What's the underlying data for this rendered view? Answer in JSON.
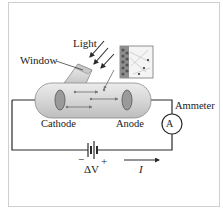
{
  "diagram": {
    "labels": {
      "light": "Light",
      "window": "Window",
      "cathode": "Cathode",
      "anode": "Anode",
      "ammeter": "Ammeter",
      "ammeter_symbol": "A",
      "battery_minus": "−",
      "battery_plus": "+",
      "voltage": "ΔV",
      "current": "I"
    },
    "icons": {
      "light_rays": "light-rays-icon",
      "inset": "electron-emission-inset-icon",
      "battery": "battery-icon",
      "ammeter": "ammeter-icon",
      "current_arrow": "arrow-right-icon"
    },
    "colors": {
      "line": "#2a2a2a",
      "tube_fill": "#d9d9d9",
      "tube_stroke": "#8a8a8a",
      "electrode": "#9a9a9a",
      "frame": "#cfcfcf"
    }
  }
}
